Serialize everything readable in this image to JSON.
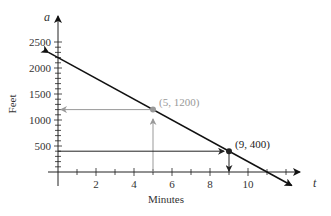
{
  "chart_data": {
    "type": "line",
    "title": "",
    "xlabel": "Minutes",
    "ylabel": "Feet",
    "x_var": "t",
    "y_var": "a",
    "xlim": [
      0,
      12
    ],
    "ylim": [
      0,
      2500
    ],
    "x_ticks": [
      2,
      4,
      6,
      8,
      10
    ],
    "x_minor_step": 1,
    "y_ticks": [
      500,
      1000,
      1500,
      2000,
      2500
    ],
    "y_minor_step": 100,
    "grid": false,
    "series": [
      {
        "name": "a = 2200 - 200t",
        "x": [
          -0.5,
          12.3
        ],
        "y": [
          2300,
          -260
        ],
        "color": "#111111",
        "arrows": "both"
      }
    ],
    "points": [
      {
        "x": 5,
        "y": 1200,
        "label": "(5, 1200)",
        "color": "#999999"
      },
      {
        "x": 9,
        "y": 400,
        "label": "(9, 400)",
        "color": "#222222"
      }
    ]
  },
  "labels": {
    "xlabel": "Minutes",
    "ylabel": "Feet",
    "x_var": "t",
    "y_var": "a",
    "x_ticks": [
      "2",
      "4",
      "6",
      "8",
      "10"
    ],
    "y_ticks": [
      "500",
      "1000",
      "1500",
      "2000",
      "2500"
    ],
    "point1": "(5, 1200)",
    "point2": "(9, 400)"
  }
}
